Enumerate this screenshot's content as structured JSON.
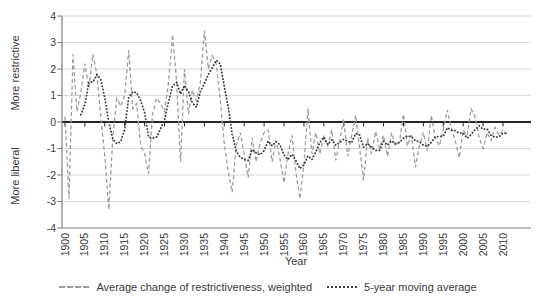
{
  "figure": {
    "y_axis_label_top": "More restrictive",
    "y_axis_label_bottom": "More liberal",
    "x_axis_label": "Year"
  },
  "colors": {
    "yearly_line": "#9e9e9e",
    "moving_avg_line": "#3d3d3d",
    "gridline": "#d9d9d9",
    "zero_line": "#262626",
    "axis": "#7f7f7f",
    "text": "#3a3a3a"
  },
  "chart_data": {
    "type": "line",
    "title": "",
    "xlabel": "Year",
    "ylabel_top": "More restrictive",
    "ylabel_bottom": "More liberal",
    "grid": "horizontal",
    "legend_position": "bottom",
    "ylim": [
      -4,
      4
    ],
    "yticks": [
      4,
      3,
      2,
      1,
      0,
      -1,
      -2,
      -3,
      -4
    ],
    "xticks": [
      1900,
      1905,
      1910,
      1915,
      1920,
      1925,
      1930,
      1935,
      1940,
      1945,
      1950,
      1955,
      1960,
      1965,
      1970,
      1975,
      1980,
      1985,
      1990,
      1995,
      2000,
      2005,
      2010
    ],
    "x": [
      1900,
      1901,
      1902,
      1903,
      1904,
      1905,
      1906,
      1907,
      1908,
      1909,
      1910,
      1911,
      1912,
      1913,
      1914,
      1915,
      1916,
      1917,
      1918,
      1919,
      1920,
      1921,
      1922,
      1923,
      1924,
      1925,
      1926,
      1927,
      1928,
      1929,
      1930,
      1931,
      1932,
      1933,
      1934,
      1935,
      1936,
      1937,
      1938,
      1939,
      1940,
      1941,
      1942,
      1943,
      1944,
      1945,
      1946,
      1947,
      1948,
      1949,
      1950,
      1951,
      1952,
      1953,
      1954,
      1955,
      1956,
      1957,
      1958,
      1959,
      1960,
      1961,
      1962,
      1963,
      1964,
      1965,
      1966,
      1967,
      1968,
      1969,
      1970,
      1971,
      1972,
      1973,
      1974,
      1975,
      1976,
      1977,
      1978,
      1979,
      1980,
      1981,
      1982,
      1983,
      1984,
      1985,
      1986,
      1987,
      1988,
      1989,
      1990,
      1991,
      1992,
      1993,
      1994,
      1995,
      1996,
      1997,
      1998,
      1999,
      2000,
      2001,
      2002,
      2003,
      2004,
      2005,
      2006,
      2007,
      2008,
      2009,
      2010,
      2011
    ],
    "series": [
      {
        "name": "Average change of restrictiveness, weighted",
        "style": "dashed",
        "color": "#9e9e9e",
        "values": [
          0.2,
          -2.9,
          2.55,
          0.4,
          1.1,
          2.2,
          1.3,
          2.55,
          1.8,
          0.2,
          -1.3,
          -3.3,
          -0.6,
          0.9,
          0.6,
          1.0,
          2.7,
          0.5,
          0.7,
          -0.9,
          -1.2,
          -1.95,
          0.3,
          0.9,
          0.7,
          0.4,
          1.5,
          3.3,
          1.6,
          -1.5,
          2.0,
          0.3,
          1.2,
          0.8,
          1.5,
          3.45,
          2.0,
          2.5,
          2.2,
          0.8,
          -0.8,
          -1.9,
          -2.65,
          -0.9,
          -0.4,
          -1.2,
          -2.1,
          -0.6,
          -1.5,
          -0.8,
          -0.4,
          -0.3,
          -1.5,
          -0.7,
          -1.4,
          -2.3,
          -1.2,
          -0.5,
          -1.9,
          -2.9,
          -1.6,
          0.5,
          -1.2,
          -0.4,
          -1.2,
          -0.55,
          -0.9,
          -0.3,
          -1.45,
          -0.7,
          0.1,
          -1.3,
          -0.5,
          0.25,
          -1.0,
          -2.2,
          -0.6,
          -1.2,
          -0.35,
          -1.0,
          -0.5,
          -1.3,
          -0.4,
          -0.9,
          -0.75,
          0.3,
          -0.9,
          -0.5,
          -1.7,
          -0.9,
          -0.4,
          -1.1,
          0.25,
          -0.6,
          -0.9,
          -0.3,
          0.45,
          -0.2,
          -0.7,
          -1.35,
          -0.3,
          -0.5,
          0.5,
          0.2,
          -0.6,
          -1.0,
          -0.4,
          -0.7,
          -0.2,
          -0.5,
          -0.3,
          -0.45
        ]
      },
      {
        "name": "5-year moving average",
        "style": "dotted",
        "color": "#3d3d3d",
        "derived": true,
        "moving_average": {
          "window": 5,
          "mode": "trailing",
          "of_series": 0
        }
      }
    ]
  }
}
